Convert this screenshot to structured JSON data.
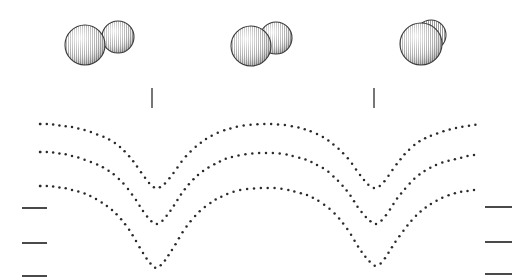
{
  "figure": {
    "title": "",
    "background_color": "#ffffff",
    "width": 527,
    "height": 279,
    "ink_color": "#2b2b2b",
    "tick_color": "#4a4a4a",
    "sphere_outline_color": "#3a3a3a",
    "sphere_fill_color": "#8c8c8c"
  },
  "molecules": [
    {
      "label": "molecule-pair-left",
      "description": "two overlapping shaded spheres, well separated",
      "spheres": [
        {
          "cx": 85,
          "cy": 45,
          "r": 20
        },
        {
          "cx": 118,
          "cy": 37,
          "r": 16
        }
      ]
    },
    {
      "label": "molecule-pair-middle",
      "description": "two overlapping shaded spheres, partially fused",
      "spheres": [
        {
          "cx": 251,
          "cy": 46,
          "r": 20
        },
        {
          "cx": 276,
          "cy": 38,
          "r": 16
        }
      ]
    },
    {
      "label": "molecule-single-right",
      "description": "single merged shaded sphere",
      "spheres": [
        {
          "cx": 423,
          "cy": 43,
          "r": 21
        }
      ]
    }
  ],
  "vertical_ticks": [
    {
      "label": "vertical-tick-left",
      "x": 152,
      "y1": 88,
      "y2": 108
    },
    {
      "label": "vertical-tick-right",
      "x": 374,
      "y1": 88,
      "y2": 108
    }
  ],
  "left_ticks": [
    {
      "label": "left-tick-1",
      "x1": 22,
      "x2": 47,
      "y": 208
    },
    {
      "label": "left-tick-2",
      "x1": 22,
      "x2": 47,
      "y": 243
    },
    {
      "label": "left-tick-3",
      "x1": 22,
      "x2": 47,
      "y": 276
    }
  ],
  "right_ticks": [
    {
      "label": "right-tick-1",
      "x1": 485,
      "x2": 512,
      "y": 207
    },
    {
      "label": "right-tick-2",
      "x1": 485,
      "x2": 512,
      "y": 242
    },
    {
      "label": "right-tick-3",
      "x1": 485,
      "x2": 512,
      "y": 274
    }
  ],
  "chart_data": {
    "type": "line",
    "title": "",
    "xlabel": "",
    "ylabel": "",
    "grid": false,
    "legend": "none",
    "marker": "dotted",
    "xlim": [
      40,
      481
    ],
    "ylim": [
      279,
      110
    ],
    "note": "Three nested dotted curves, each with two V-shaped minima beneath the molecular sphere models. Coordinates are in screen pixels (y increases downward).",
    "series": [
      {
        "name": "curve-upper",
        "points": [
          [
            40,
            124
          ],
          [
            48,
            124
          ],
          [
            56,
            125
          ],
          [
            64,
            126
          ],
          [
            72,
            127
          ],
          [
            80,
            129
          ],
          [
            88,
            131
          ],
          [
            96,
            134
          ],
          [
            104,
            137
          ],
          [
            112,
            141
          ],
          [
            120,
            147
          ],
          [
            128,
            155
          ],
          [
            136,
            165
          ],
          [
            143,
            175
          ],
          [
            150,
            184
          ],
          [
            156,
            188
          ],
          [
            162,
            186
          ],
          [
            168,
            180
          ],
          [
            175,
            171
          ],
          [
            182,
            161
          ],
          [
            190,
            152
          ],
          [
            198,
            145
          ],
          [
            206,
            139
          ],
          [
            215,
            134
          ],
          [
            225,
            130
          ],
          [
            236,
            127
          ],
          [
            248,
            125
          ],
          [
            260,
            124
          ],
          [
            272,
            124
          ],
          [
            284,
            125
          ],
          [
            296,
            127
          ],
          [
            307,
            130
          ],
          [
            317,
            134
          ],
          [
            326,
            139
          ],
          [
            334,
            145
          ],
          [
            342,
            152
          ],
          [
            350,
            161
          ],
          [
            357,
            171
          ],
          [
            364,
            180
          ],
          [
            370,
            186
          ],
          [
            376,
            188
          ],
          [
            382,
            184
          ],
          [
            389,
            175
          ],
          [
            396,
            165
          ],
          [
            404,
            155
          ],
          [
            412,
            147
          ],
          [
            420,
            141
          ],
          [
            428,
            137
          ],
          [
            436,
            134
          ],
          [
            444,
            131
          ],
          [
            452,
            129
          ],
          [
            460,
            127
          ],
          [
            468,
            126
          ],
          [
            474,
            125
          ],
          [
            480,
            124
          ]
        ]
      },
      {
        "name": "curve-middle",
        "points": [
          [
            40,
            152
          ],
          [
            48,
            152
          ],
          [
            56,
            153
          ],
          [
            64,
            154
          ],
          [
            72,
            156
          ],
          [
            80,
            158
          ],
          [
            88,
            161
          ],
          [
            96,
            164
          ],
          [
            104,
            168
          ],
          [
            112,
            173
          ],
          [
            120,
            180
          ],
          [
            128,
            189
          ],
          [
            136,
            200
          ],
          [
            143,
            211
          ],
          [
            150,
            220
          ],
          [
            156,
            224
          ],
          [
            162,
            221
          ],
          [
            168,
            214
          ],
          [
            175,
            204
          ],
          [
            182,
            193
          ],
          [
            190,
            183
          ],
          [
            198,
            175
          ],
          [
            206,
            169
          ],
          [
            215,
            164
          ],
          [
            225,
            159
          ],
          [
            236,
            156
          ],
          [
            248,
            154
          ],
          [
            260,
            153
          ],
          [
            272,
            153
          ],
          [
            284,
            154
          ],
          [
            296,
            157
          ],
          [
            307,
            160
          ],
          [
            317,
            165
          ],
          [
            326,
            170
          ],
          [
            334,
            177
          ],
          [
            342,
            185
          ],
          [
            350,
            195
          ],
          [
            357,
            206
          ],
          [
            364,
            215
          ],
          [
            370,
            221
          ],
          [
            376,
            224
          ],
          [
            382,
            220
          ],
          [
            389,
            211
          ],
          [
            396,
            200
          ],
          [
            404,
            190
          ],
          [
            412,
            181
          ],
          [
            420,
            174
          ],
          [
            428,
            169
          ],
          [
            436,
            165
          ],
          [
            444,
            162
          ],
          [
            452,
            160
          ],
          [
            460,
            158
          ],
          [
            468,
            156
          ],
          [
            474,
            155
          ],
          [
            480,
            155
          ]
        ]
      },
      {
        "name": "curve-lower",
        "points": [
          [
            40,
            186
          ],
          [
            48,
            186
          ],
          [
            56,
            187
          ],
          [
            64,
            188
          ],
          [
            72,
            190
          ],
          [
            80,
            192
          ],
          [
            88,
            195
          ],
          [
            96,
            199
          ],
          [
            104,
            204
          ],
          [
            112,
            210
          ],
          [
            120,
            218
          ],
          [
            128,
            228
          ],
          [
            136,
            241
          ],
          [
            143,
            253
          ],
          [
            150,
            263
          ],
          [
            156,
            268
          ],
          [
            162,
            264
          ],
          [
            168,
            256
          ],
          [
            175,
            245
          ],
          [
            182,
            233
          ],
          [
            190,
            222
          ],
          [
            198,
            213
          ],
          [
            206,
            206
          ],
          [
            215,
            200
          ],
          [
            225,
            195
          ],
          [
            236,
            191
          ],
          [
            248,
            189
          ],
          [
            260,
            188
          ],
          [
            272,
            188
          ],
          [
            284,
            189
          ],
          [
            296,
            192
          ],
          [
            307,
            195
          ],
          [
            317,
            200
          ],
          [
            326,
            206
          ],
          [
            334,
            213
          ],
          [
            342,
            222
          ],
          [
            350,
            233
          ],
          [
            357,
            245
          ],
          [
            364,
            255
          ],
          [
            370,
            262
          ],
          [
            376,
            266
          ],
          [
            382,
            262
          ],
          [
            389,
            252
          ],
          [
            396,
            241
          ],
          [
            404,
            230
          ],
          [
            412,
            220
          ],
          [
            420,
            212
          ],
          [
            428,
            206
          ],
          [
            436,
            201
          ],
          [
            444,
            197
          ],
          [
            452,
            194
          ],
          [
            460,
            192
          ],
          [
            468,
            191
          ],
          [
            474,
            190
          ],
          [
            480,
            190
          ]
        ]
      }
    ]
  }
}
